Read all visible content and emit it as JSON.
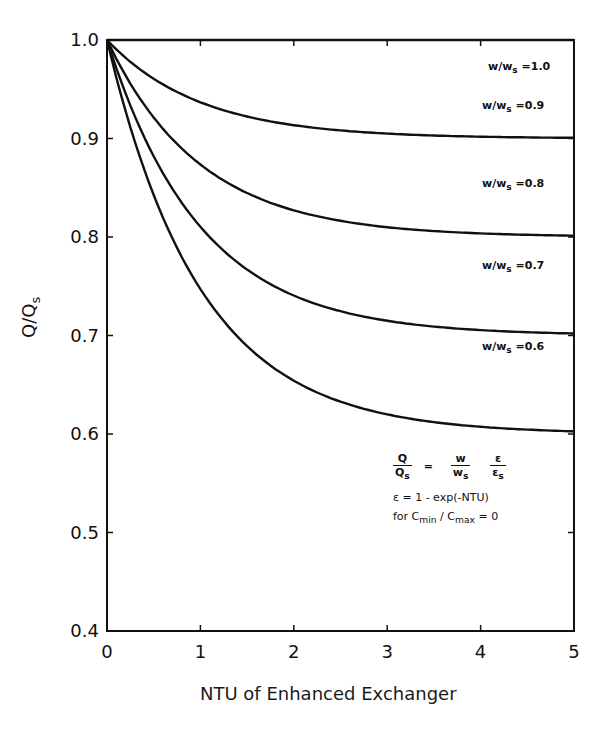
{
  "chart_data": {
    "type": "line",
    "title": "",
    "xlabel": "NTU of Enhanced Exchanger",
    "ylabel": "Q/Qs",
    "xlim": [
      0,
      5
    ],
    "ylim": [
      0.4,
      1.0
    ],
    "x_ticks": [
      "0",
      "1",
      "2",
      "3",
      "4",
      "5"
    ],
    "y_ticks": [
      "0.4",
      "0.5",
      "0.6",
      "0.7",
      "0.8",
      "0.9",
      "1.0"
    ],
    "grid": false,
    "legend_position": "inline labels at right",
    "x": [
      0,
      0.5,
      1,
      1.5,
      2,
      2.5,
      3,
      3.5,
      4,
      4.5,
      5
    ],
    "series": [
      {
        "name": "w/ws = 1.0",
        "ratio": 1.0,
        "values": [
          1.0,
          1.0,
          1.0,
          1.0,
          1.0,
          1.0,
          1.0,
          1.0,
          1.0,
          1.0,
          1.0
        ]
      },
      {
        "name": "w/ws = 0.9",
        "ratio": 0.9,
        "values": [
          1.0,
          0.961,
          0.937,
          0.922,
          0.914,
          0.908,
          0.905,
          0.903,
          0.902,
          0.901,
          0.901
        ]
      },
      {
        "name": "w/ws = 0.8",
        "ratio": 0.8,
        "values": [
          1.0,
          0.921,
          0.874,
          0.845,
          0.827,
          0.816,
          0.81,
          0.806,
          0.804,
          0.802,
          0.801
        ]
      },
      {
        "name": "w/ws = 0.7",
        "ratio": 0.7,
        "values": [
          1.0,
          0.882,
          0.81,
          0.767,
          0.741,
          0.725,
          0.715,
          0.709,
          0.705,
          0.703,
          0.702
        ]
      },
      {
        "name": "w/ws = 0.6",
        "ratio": 0.6,
        "values": [
          1.0,
          0.843,
          0.747,
          0.689,
          0.654,
          0.633,
          0.62,
          0.612,
          0.607,
          0.604,
          0.603
        ]
      }
    ],
    "annotations": [
      "Q/Qs = (w/ws)(ε/εs)",
      "ε = 1 - exp(-NTU)",
      "for Cmin / Cmax = 0"
    ]
  },
  "labels": {
    "xlabel": "NTU of Enhanced Exchanger",
    "ylabel_main": "Q/Q",
    "ylabel_sub": "s",
    "curve_prefix": "w/w",
    "curve_sub": "s",
    "curves": [
      "=1.0",
      "=0.9",
      "=0.8",
      "=0.7",
      "=0.6"
    ],
    "formula": {
      "lhs_num": "Q",
      "lhs_den": "Q",
      "lhs_den_sub": "s",
      "eq": "=",
      "r1_num": "w",
      "r1_den": "w",
      "r1_den_sub": "s",
      "r2_num": "ε",
      "r2_den": "ε",
      "r2_den_sub": "s",
      "line2": "ε = 1 - exp(-NTU)",
      "line3_pre": "for C",
      "line3_sub1": "min",
      "line3_mid": " / C",
      "line3_sub2": "max",
      "line3_post": " = 0"
    }
  }
}
